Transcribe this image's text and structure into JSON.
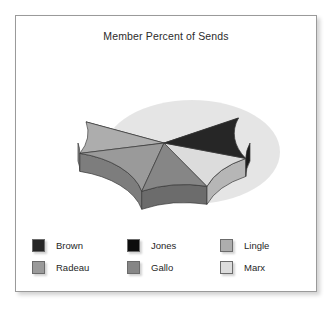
{
  "chart": {
    "title": "Member Percent of Sends"
  },
  "legend": {
    "columns": [
      {
        "entries": [
          {
            "label": "Brown",
            "color": "#262626"
          },
          {
            "label": "Radeau",
            "color": "#9a9a9a"
          }
        ]
      },
      {
        "entries": [
          {
            "label": "Jones",
            "color": "#0d0d0d"
          },
          {
            "label": "Gallo",
            "color": "#868686"
          }
        ]
      },
      {
        "entries": [
          {
            "label": "Lingle",
            "color": "#adadad"
          },
          {
            "label": "Marx",
            "color": "#dcdcdc"
          }
        ]
      }
    ]
  },
  "chart_data": {
    "type": "pie",
    "title": "Member Percent of Sends",
    "xlabel": "",
    "ylabel": "",
    "grid": false,
    "legend_position": "bottom",
    "three_d": true,
    "labels": [
      "Brown",
      "Jones",
      "Lingle",
      "Radeau",
      "Gallo",
      "Marx"
    ],
    "values": [
      13,
      26,
      20,
      17,
      11,
      13
    ],
    "unit": "percent",
    "colors": [
      "#262626",
      "#0d0d0d",
      "#adadad",
      "#9a9a9a",
      "#868686",
      "#dcdcdc"
    ],
    "slices": [
      {
        "label": "Jones",
        "value": 26,
        "color": "#0d0d0d",
        "side_color": "#070707",
        "start_deg": 30,
        "end_deg": 155
      },
      {
        "label": "Lingle",
        "value": 20,
        "color": "#adadad",
        "side_color": "#8d8d8d",
        "start_deg": 155,
        "end_deg": 192
      },
      {
        "label": "Radeau",
        "value": 17,
        "color": "#9a9a9a",
        "side_color": "#7d7d7d",
        "start_deg": 192,
        "end_deg": 255
      },
      {
        "label": "Gallo",
        "value": 11,
        "color": "#868686",
        "side_color": "#6c6c6c",
        "start_deg": 255,
        "end_deg": 300
      },
      {
        "label": "Marx",
        "value": 13,
        "color": "#dcdcdc",
        "side_color": "#b6b6b6",
        "start_deg": 300,
        "end_deg": 342
      },
      {
        "label": "Brown",
        "value": 13,
        "color": "#262626",
        "side_color": "#1a1a1a",
        "start_deg": 342,
        "end_deg": 390
      }
    ],
    "geometry": {
      "cx": 172,
      "cy": 103,
      "rx": 86,
      "ry": 50,
      "depth": 18
    }
  }
}
